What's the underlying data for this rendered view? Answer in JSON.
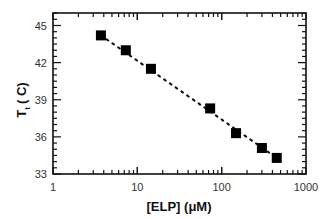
{
  "chart_data": {
    "type": "scatter",
    "title": "",
    "xlabel": "[ELP] (μM)",
    "ylabel": "T_t ( C)",
    "ylabel_main": "T",
    "ylabel_sub": "t",
    "ylabel_unit": "( C)",
    "xscale": "log",
    "xlim": [
      1,
      1000
    ],
    "ylim": [
      33,
      46
    ],
    "x_ticks": [
      1,
      10,
      100,
      1000
    ],
    "x_tick_labels": [
      "1",
      "10",
      "100",
      "1000"
    ],
    "y_ticks": [
      33,
      36,
      39,
      42,
      45
    ],
    "y_tick_labels": [
      "33",
      "36",
      "39",
      "42",
      "45"
    ],
    "grid": false,
    "legend": null,
    "series": [
      {
        "name": "ELP transition temperature",
        "marker": "square",
        "color": "#000000",
        "x": [
          3.7,
          7.3,
          14.5,
          73,
          148,
          300,
          450
        ],
        "y": [
          44.2,
          43.0,
          41.5,
          38.3,
          36.3,
          35.1,
          34.3
        ]
      },
      {
        "name": "fit",
        "style": "dotted-line",
        "color": "#000000",
        "x": [
          3.7,
          450
        ],
        "y": [
          44.2,
          34.3
        ]
      }
    ]
  }
}
